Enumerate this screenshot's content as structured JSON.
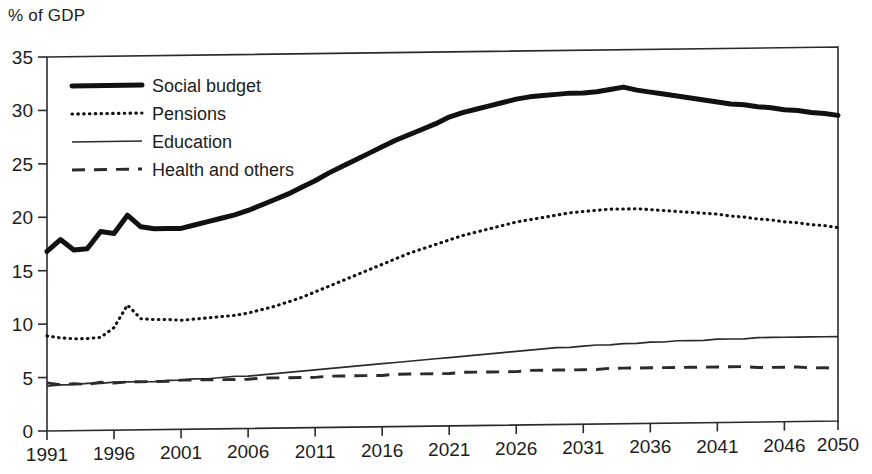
{
  "chart_data": {
    "type": "line",
    "title": "",
    "ylabel": "% of GDP",
    "xlabel": "",
    "ylim": [
      0,
      35
    ],
    "xlim": [
      1991,
      2050
    ],
    "grid": false,
    "legend_position": "top-left-inside",
    "yticks": [
      0,
      5,
      10,
      15,
      20,
      25,
      30,
      35
    ],
    "xticks": [
      1991,
      1996,
      2001,
      2006,
      2011,
      2016,
      2021,
      2026,
      2031,
      2036,
      2041,
      2046,
      2050
    ],
    "x": [
      1991,
      1992,
      1993,
      1994,
      1995,
      1996,
      1997,
      1998,
      1999,
      2000,
      2001,
      2002,
      2003,
      2004,
      2005,
      2006,
      2007,
      2008,
      2009,
      2010,
      2011,
      2012,
      2013,
      2014,
      2015,
      2016,
      2017,
      2018,
      2019,
      2020,
      2021,
      2022,
      2023,
      2024,
      2025,
      2026,
      2027,
      2028,
      2029,
      2030,
      2031,
      2032,
      2033,
      2034,
      2035,
      2036,
      2037,
      2038,
      2039,
      2040,
      2041,
      2042,
      2043,
      2044,
      2045,
      2046,
      2047,
      2048,
      2049,
      2050
    ],
    "series": [
      {
        "name": "Social budget",
        "style": "thick-solid",
        "color": "#111111",
        "values": [
          16.8,
          17.9,
          16.9,
          17.0,
          18.6,
          18.4,
          20.1,
          19.0,
          18.8,
          18.8,
          18.8,
          19.1,
          19.4,
          19.7,
          20.0,
          20.4,
          20.9,
          21.4,
          21.9,
          22.5,
          23.1,
          23.8,
          24.4,
          25.0,
          25.6,
          26.2,
          26.8,
          27.3,
          27.8,
          28.3,
          28.9,
          29.3,
          29.6,
          29.9,
          30.2,
          30.5,
          30.7,
          30.8,
          30.9,
          31.0,
          31.0,
          31.1,
          31.3,
          31.5,
          31.2,
          31.0,
          30.8,
          30.6,
          30.4,
          30.2,
          30.0,
          29.8,
          29.7,
          29.5,
          29.4,
          29.2,
          29.1,
          28.9,
          28.8,
          28.6
        ]
      },
      {
        "name": "Pensions",
        "style": "dotted",
        "color": "#111111",
        "values": [
          8.9,
          8.7,
          8.6,
          8.6,
          8.7,
          9.6,
          11.7,
          10.4,
          10.3,
          10.3,
          10.2,
          10.3,
          10.4,
          10.5,
          10.6,
          10.8,
          11.1,
          11.4,
          11.8,
          12.2,
          12.7,
          13.2,
          13.7,
          14.2,
          14.7,
          15.2,
          15.7,
          16.2,
          16.6,
          17.0,
          17.4,
          17.8,
          18.1,
          18.4,
          18.7,
          19.0,
          19.2,
          19.4,
          19.6,
          19.8,
          19.9,
          20.0,
          20.1,
          20.1,
          20.1,
          20.0,
          19.9,
          19.8,
          19.7,
          19.6,
          19.5,
          19.3,
          19.2,
          19.0,
          18.9,
          18.7,
          18.6,
          18.4,
          18.3,
          18.1
        ]
      },
      {
        "name": "Education",
        "style": "thin-solid",
        "color": "#2b2b2b",
        "values": [
          4.2,
          4.3,
          4.3,
          4.4,
          4.4,
          4.5,
          4.5,
          4.5,
          4.5,
          4.6,
          4.6,
          4.7,
          4.7,
          4.8,
          4.9,
          4.9,
          5.0,
          5.1,
          5.2,
          5.3,
          5.4,
          5.5,
          5.6,
          5.7,
          5.8,
          5.9,
          6.0,
          6.1,
          6.2,
          6.3,
          6.4,
          6.5,
          6.6,
          6.7,
          6.8,
          6.9,
          7.0,
          7.1,
          7.2,
          7.2,
          7.3,
          7.4,
          7.4,
          7.5,
          7.5,
          7.6,
          7.6,
          7.7,
          7.7,
          7.7,
          7.8,
          7.8,
          7.8,
          7.9,
          7.9,
          7.9,
          7.9,
          7.9,
          7.9,
          7.9
        ]
      },
      {
        "name": "Health and others",
        "style": "dashed",
        "color": "#2b2b2b",
        "values": [
          4.5,
          4.3,
          4.4,
          4.3,
          4.5,
          4.4,
          4.5,
          4.5,
          4.5,
          4.5,
          4.6,
          4.6,
          4.6,
          4.6,
          4.6,
          4.6,
          4.7,
          4.7,
          4.7,
          4.7,
          4.7,
          4.8,
          4.8,
          4.8,
          4.8,
          4.8,
          4.9,
          4.9,
          4.9,
          4.9,
          4.9,
          5.0,
          5.0,
          5.0,
          5.0,
          5.0,
          5.1,
          5.1,
          5.1,
          5.1,
          5.1,
          5.1,
          5.2,
          5.2,
          5.2,
          5.2,
          5.2,
          5.2,
          5.2,
          5.2,
          5.2,
          5.2,
          5.2,
          5.1,
          5.1,
          5.1,
          5.1,
          5.0,
          5.0,
          4.9
        ]
      }
    ]
  },
  "legend": {
    "items": [
      {
        "label": "Social budget"
      },
      {
        "label": "Pensions"
      },
      {
        "label": "Education"
      },
      {
        "label": "Health and others"
      }
    ]
  }
}
